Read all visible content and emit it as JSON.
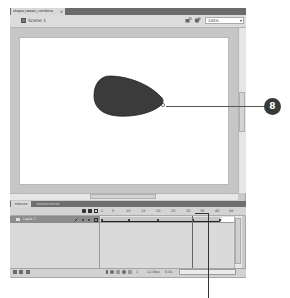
{
  "document": {
    "tab_label": "shape_tween_combine",
    "close_glyph": "×"
  },
  "editbar": {
    "scene_label": "Scene 1",
    "zoom_value": "100%",
    "icons": [
      "edit-symbols-icon",
      "edit-scene-icon"
    ]
  },
  "stage": {
    "background": "#ffffff",
    "shape": {
      "type": "teardrop",
      "fill": "#3b3b3b"
    }
  },
  "timeline": {
    "tabs": [
      {
        "label": "TIMELINE",
        "active": true
      },
      {
        "label": "MOTION EDITOR",
        "active": false
      }
    ],
    "ruler": [
      "1",
      "5",
      "10",
      "15",
      "20",
      "25",
      "30",
      "35",
      "40",
      "45"
    ],
    "layers": [
      {
        "name": "Layer 1"
      }
    ],
    "status": {
      "current_frame": "1",
      "fps": "12.0fps",
      "elapsed": "0.0s"
    }
  },
  "callouts": [
    {
      "label": "8"
    }
  ]
}
